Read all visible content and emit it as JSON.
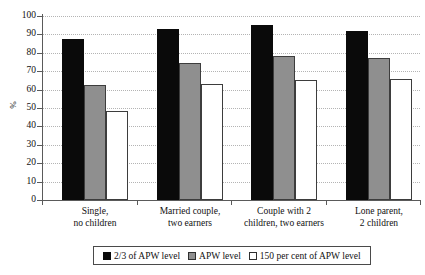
{
  "chart_data": {
    "type": "bar",
    "title": "",
    "xlabel": "",
    "ylabel": "%",
    "ylim": [
      0,
      100
    ],
    "yticks": [
      0,
      10,
      20,
      30,
      40,
      50,
      60,
      70,
      80,
      90,
      100
    ],
    "grid": true,
    "legend_position": "bottom",
    "categories": [
      "Single,\nno children",
      "Married couple,\ntwo earners",
      "Couple with 2\nchildren, two earners",
      "Lone parent,\n2 children"
    ],
    "category_lines": [
      [
        "Single,",
        "no children"
      ],
      [
        "Married couple,",
        "two earners"
      ],
      [
        "Couple with 2",
        "children, two earners"
      ],
      [
        "Lone parent,",
        "2 children"
      ]
    ],
    "series": [
      {
        "name": "2/3 of APW level",
        "color": "#0a0a0a",
        "values": [
          87.5,
          93,
          95,
          92
        ]
      },
      {
        "name": "APW level",
        "color": "#8f8f8f",
        "values": [
          62.5,
          74.5,
          78,
          77
        ]
      },
      {
        "name": "150 per cent of APW level",
        "color": "#ffffff",
        "values": [
          48.5,
          63,
          65,
          65.5
        ]
      }
    ]
  },
  "legend": {
    "items": [
      {
        "label": "2/3 of APW level"
      },
      {
        "label": "APW level"
      },
      {
        "label": "150 per cent of APW level"
      }
    ]
  }
}
